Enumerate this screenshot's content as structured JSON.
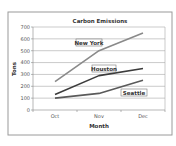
{
  "chart_data": {
    "type": "line",
    "title": "Carbon Emissions",
    "xlabel": "Month",
    "ylabel": "Tons",
    "categories": [
      "Oct",
      "Nov",
      "Dec"
    ],
    "ylim": [
      0,
      700
    ],
    "yticks": [
      0,
      100,
      200,
      300,
      400,
      500,
      600,
      700
    ],
    "grid": true,
    "legend_position": "inline labels",
    "series": [
      {
        "name": "New York",
        "values": [
          240,
          500,
          650
        ],
        "color": "#8a8a8a"
      },
      {
        "name": "Houston",
        "values": [
          130,
          290,
          350
        ],
        "color": "#3c3c3c"
      },
      {
        "name": "Seattle",
        "values": [
          100,
          140,
          250
        ],
        "color": "#5a5a5a"
      }
    ]
  },
  "labels": {
    "title": "Carbon Emissions",
    "xlabel": "Month",
    "ylabel": "Tons",
    "series_names": [
      "New York",
      "Houston",
      "Seattle"
    ]
  }
}
